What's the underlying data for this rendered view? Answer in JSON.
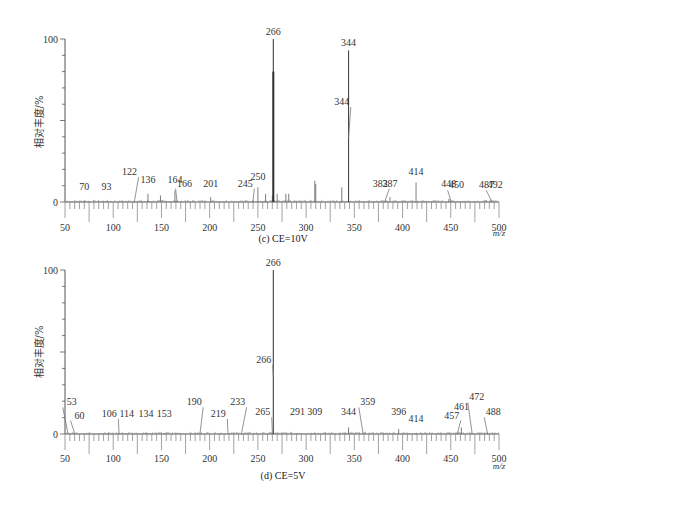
{
  "figure": {
    "colors": {
      "axis": "#555555",
      "peak": "#6e6e6e",
      "major_peak": "#444444",
      "leader": "#777777",
      "noise": "#888888"
    }
  },
  "chart_data": [
    {
      "type": "bar",
      "id": "c",
      "caption": "(c) CE=10V",
      "xlabel": "m/z",
      "ylabel": "相对丰度/%",
      "xlim": [
        50,
        500
      ],
      "ylim": [
        0,
        100
      ],
      "xticks": [
        50,
        100,
        150,
        200,
        250,
        300,
        350,
        400,
        450,
        500
      ],
      "yticks": [
        0,
        100
      ],
      "grid": false,
      "peaks": [
        {
          "mz": 70,
          "intensity": 1,
          "label": "70",
          "label_y": 5
        },
        {
          "mz": 93,
          "intensity": 0.5,
          "label": "93",
          "label_y": 5
        },
        {
          "mz": 122,
          "intensity": 0.5,
          "label": "122",
          "label_y": 14,
          "label_mz": 117
        },
        {
          "mz": 136,
          "intensity": 5,
          "label": "136",
          "label_y": 9
        },
        {
          "mz": 149,
          "intensity": 4
        },
        {
          "mz": 164,
          "intensity": 7,
          "label": "164",
          "label_y": 9
        },
        {
          "mz": 166,
          "intensity": 1,
          "label": "166",
          "label_y": 7,
          "label_mz": 174
        },
        {
          "mz": 201,
          "intensity": 3,
          "label": "201",
          "label_y": 7
        },
        {
          "mz": 245,
          "intensity": 1,
          "label": "245",
          "label_y": 7,
          "label_mz": 237
        },
        {
          "mz": 250,
          "intensity": 9,
          "label": "250",
          "label_y": 11
        },
        {
          "mz": 258,
          "intensity": 5
        },
        {
          "mz": 265,
          "intensity": 4
        },
        {
          "mz": 266,
          "intensity": 100,
          "label": "266",
          "label_y": 100,
          "secondary_intensity": 80
        },
        {
          "mz": 270,
          "intensity": 5
        },
        {
          "mz": 279,
          "intensity": 5
        },
        {
          "mz": 282,
          "intensity": 5
        },
        {
          "mz": 309,
          "intensity": 13
        },
        {
          "mz": 310,
          "intensity": 11
        },
        {
          "mz": 337,
          "intensity": 9
        },
        {
          "mz": 344,
          "intensity": 93,
          "label": "344",
          "label_y": 93
        },
        {
          "mz": 344,
          "intensity": 39,
          "label": "344",
          "label_y": 57,
          "label_mz": 337,
          "leader_only": true
        },
        {
          "mz": 382,
          "intensity": 1,
          "label": "382",
          "label_y": 7,
          "label_mz": 377
        },
        {
          "mz": 387,
          "intensity": 3,
          "label": "387",
          "label_y": 7
        },
        {
          "mz": 414,
          "intensity": 12,
          "label": "414",
          "label_y": 14
        },
        {
          "mz": 448,
          "intensity": 2,
          "label": "448",
          "label_y": 7
        },
        {
          "mz": 450,
          "intensity": 1,
          "label": "450",
          "label_y": 6,
          "label_mz": 456
        },
        {
          "mz": 487,
          "intensity": 1,
          "label": "487",
          "label_y": 6
        },
        {
          "mz": 492,
          "intensity": 1,
          "label": "492",
          "label_y": 6,
          "label_mz": 496
        }
      ]
    },
    {
      "type": "bar",
      "id": "d",
      "caption": "(d) CE=5V",
      "xlabel": "m/z",
      "ylabel": "相对丰度/%",
      "xlim": [
        50,
        500
      ],
      "ylim": [
        0,
        100
      ],
      "xticks": [
        50,
        100,
        150,
        200,
        250,
        300,
        350,
        400,
        450,
        500
      ],
      "yticks": [
        0,
        100
      ],
      "grid": false,
      "peaks": [
        {
          "mz": 53,
          "intensity": 0.5,
          "label": "53",
          "label_y": 15,
          "label_mz": 57
        },
        {
          "mz": 60,
          "intensity": 0.5,
          "label": "60",
          "label_y": 7,
          "label_mz": 65
        },
        {
          "mz": 106,
          "intensity": 0.5,
          "label": "106",
          "label_y": 8,
          "label_mz": 96
        },
        {
          "mz": 114,
          "intensity": 0.5,
          "label": "114",
          "label_y": 8
        },
        {
          "mz": 134,
          "intensity": 1,
          "label": "134",
          "label_y": 8
        },
        {
          "mz": 153,
          "intensity": 0.5,
          "label": "153",
          "label_y": 8
        },
        {
          "mz": 190,
          "intensity": 0.5,
          "label": "190",
          "label_y": 15,
          "label_mz": 184
        },
        {
          "mz": 219,
          "intensity": 0.5,
          "label": "219",
          "label_y": 8,
          "label_mz": 209
        },
        {
          "mz": 233,
          "intensity": 0.5,
          "label": "233",
          "label_y": 15,
          "label_mz": 229
        },
        {
          "mz": 265,
          "intensity": 1,
          "label": "265",
          "label_y": 9,
          "label_mz": 255
        },
        {
          "mz": 266,
          "intensity": 100,
          "label": "266",
          "label_y": 100
        },
        {
          "mz": 266,
          "intensity": 35,
          "label": "266",
          "label_y": 41,
          "label_mz": 256,
          "leader_only": true
        },
        {
          "mz": 291,
          "intensity": 0.5,
          "label": "291",
          "label_y": 9
        },
        {
          "mz": 309,
          "intensity": 1,
          "label": "309",
          "label_y": 9
        },
        {
          "mz": 344,
          "intensity": 4,
          "label": "344",
          "label_y": 9
        },
        {
          "mz": 359,
          "intensity": 0.5,
          "label": "359",
          "label_y": 15,
          "label_mz": 364
        },
        {
          "mz": 396,
          "intensity": 3,
          "label": "396",
          "label_y": 9
        },
        {
          "mz": 414,
          "intensity": 0.5,
          "label": "414",
          "label_y": 5
        },
        {
          "mz": 457,
          "intensity": 0.5,
          "label": "457",
          "label_y": 7,
          "label_mz": 451
        },
        {
          "mz": 461,
          "intensity": 4,
          "label": "461",
          "label_y": 12
        },
        {
          "mz": 472,
          "intensity": 1,
          "label": "472",
          "label_y": 18,
          "label_mz": 477
        },
        {
          "mz": 488,
          "intensity": 0.5,
          "label": "488",
          "label_y": 9,
          "label_mz": 494
        }
      ]
    }
  ]
}
